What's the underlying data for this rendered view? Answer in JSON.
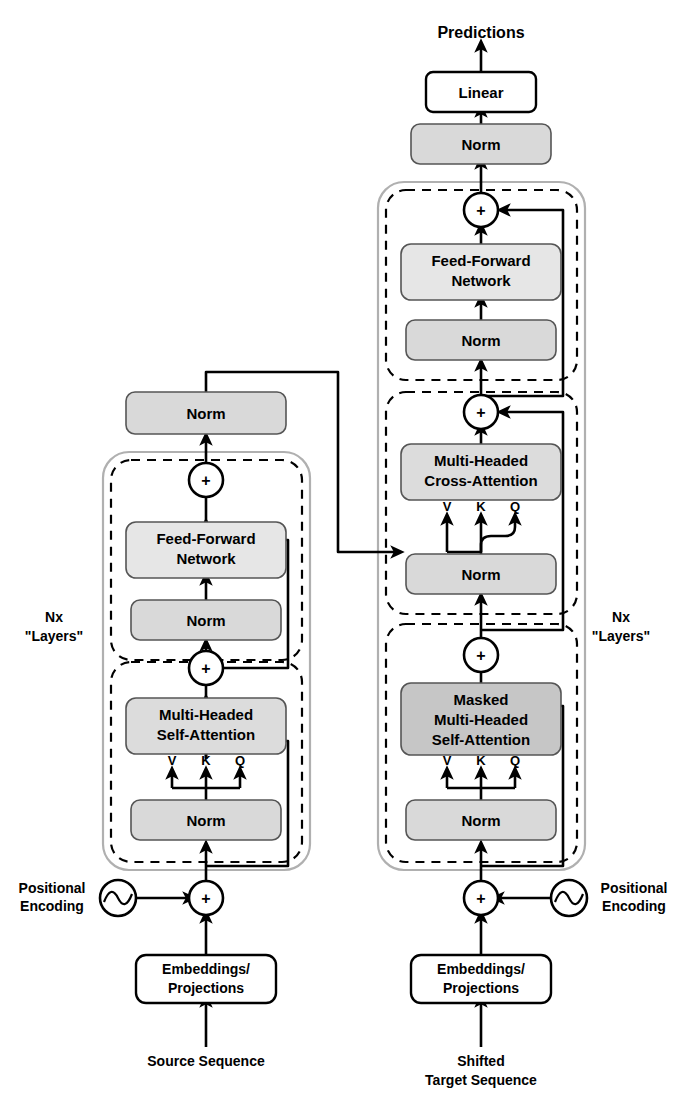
{
  "diagram": {
    "colors": {
      "norm_fill": "#d9d9d9",
      "ffn_fill": "#e6e6e6",
      "attention_fill": "#dcdcdc",
      "masked_attention_fill": "#c6c6c6",
      "plain_fill": "#ffffff",
      "group_outline": "#b0b0b0",
      "dashed_outline": "#000000",
      "wire": "#000000"
    },
    "output": {
      "predictions_label": "Predictions",
      "linear_label": "Linear",
      "final_norm_label": "Norm"
    },
    "encoder": {
      "stack_label_line1": "Nx",
      "stack_label_line2": "\"Layers\"",
      "output_norm_label": "Norm",
      "sublayers": [
        {
          "name": "feed-forward-sublayer",
          "norm_label": "Norm",
          "main_label_line1": "Feed-Forward",
          "main_label_line2": "Network",
          "add_symbol": "+"
        },
        {
          "name": "self-attention-sublayer",
          "norm_label": "Norm",
          "main_label_line1": "Multi-Headed",
          "main_label_line2": "Self-Attention",
          "add_symbol": "+",
          "qkv": [
            "V",
            "K",
            "Q"
          ]
        }
      ],
      "input": {
        "positional_encoding_line1": "Positional",
        "positional_encoding_line2": "Encoding",
        "add_symbol": "+",
        "embeddings_line1": "Embeddings/",
        "embeddings_line2": "Projections",
        "sequence_line1": "Source Sequence",
        "sequence_line2": ""
      }
    },
    "decoder": {
      "stack_label_line1": "Nx",
      "stack_label_line2": "\"Layers\"",
      "sublayers": [
        {
          "name": "feed-forward-sublayer",
          "norm_label": "Norm",
          "main_label_line1": "Feed-Forward",
          "main_label_line2": "Network",
          "add_symbol": "+"
        },
        {
          "name": "cross-attention-sublayer",
          "norm_label": "Norm",
          "main_label_line1": "Multi-Headed",
          "main_label_line2": "Cross-Attention",
          "add_symbol": "+",
          "qkv": [
            "V",
            "K",
            "Q"
          ]
        },
        {
          "name": "masked-self-attention-sublayer",
          "norm_label": "Norm",
          "main_label_line1": "Masked",
          "main_label_line2": "Multi-Headed",
          "main_label_line3": "Self-Attention",
          "add_symbol": "+",
          "qkv": [
            "V",
            "K",
            "Q"
          ]
        }
      ],
      "input": {
        "positional_encoding_line1": "Positional",
        "positional_encoding_line2": "Encoding",
        "add_symbol": "+",
        "embeddings_line1": "Embeddings/",
        "embeddings_line2": "Projections",
        "sequence_line1": "Shifted",
        "sequence_line2": "Target Sequence"
      }
    }
  }
}
